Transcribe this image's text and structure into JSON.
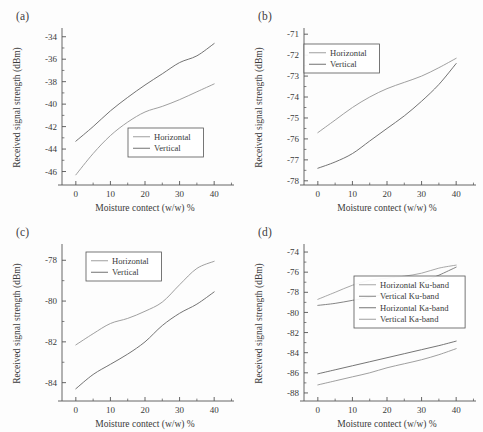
{
  "figure": {
    "background": "#fdfdfd",
    "axis_color": "#555555",
    "text_color": "#3a3a3a",
    "panel_count": 4
  },
  "common": {
    "xlabel": "Moisture contect (w/w) %",
    "ylabel": "Received signal strength (dBm)",
    "xticks": [
      0,
      10,
      20,
      30,
      40
    ],
    "xlim": [
      -4,
      44
    ]
  },
  "panels": [
    {
      "id": "a",
      "label": "(a)"
    },
    {
      "id": "b",
      "label": "(b)"
    },
    {
      "id": "c",
      "label": "(c)"
    },
    {
      "id": "d",
      "label": "(d)"
    }
  ],
  "chart_data": [
    {
      "panel": "a",
      "type": "line",
      "title": "(a)",
      "xlabel": "Moisture contect (w/w) %",
      "ylabel": "Received signal strength (dBm)",
      "xlim": [
        -4,
        44
      ],
      "ylim": [
        -47.2,
        -33.4
      ],
      "xticks": [
        0,
        10,
        20,
        30,
        40
      ],
      "yticks": [
        -34,
        -36,
        -38,
        -40,
        -42,
        -44,
        -46
      ],
      "grid": false,
      "legend_position": "lower-right",
      "x": [
        0,
        5,
        10,
        15,
        20,
        25,
        30,
        35,
        40
      ],
      "series": [
        {
          "name": "Horizontal",
          "color": "#9a9a9a",
          "values": [
            -46.3,
            -44.4,
            -42.8,
            -41.6,
            -40.7,
            -40.2,
            -39.6,
            -38.9,
            -38.2
          ]
        },
        {
          "name": "Vertical",
          "color": "#6b6b6b",
          "values": [
            -43.3,
            -42.0,
            -40.6,
            -39.4,
            -38.3,
            -37.3,
            -36.3,
            -35.7,
            -34.6
          ]
        }
      ]
    },
    {
      "panel": "b",
      "type": "line",
      "title": "(b)",
      "xlabel": "Moisture contect (w/w) %",
      "ylabel": "Received signal strength (dBm)",
      "xlim": [
        -4,
        44
      ],
      "ylim": [
        -78.2,
        -70.8
      ],
      "xticks": [
        0,
        10,
        20,
        30,
        40
      ],
      "yticks": [
        -71,
        -72,
        -73,
        -74,
        -75,
        -76,
        -77,
        -78
      ],
      "grid": false,
      "legend_position": "upper-left",
      "x": [
        0,
        5,
        10,
        15,
        20,
        25,
        30,
        35,
        40
      ],
      "series": [
        {
          "name": "Horizontal",
          "color": "#9a9a9a",
          "values": [
            -75.7,
            -75.1,
            -74.5,
            -74.0,
            -73.6,
            -73.3,
            -73.0,
            -72.6,
            -72.15
          ]
        },
        {
          "name": "Vertical",
          "color": "#6b6b6b",
          "values": [
            -77.4,
            -77.1,
            -76.7,
            -76.1,
            -75.5,
            -74.9,
            -74.2,
            -73.4,
            -72.4
          ]
        }
      ]
    },
    {
      "panel": "c",
      "type": "line",
      "title": "(c)",
      "xlabel": "Moisture contect (w/w) %",
      "ylabel": "Received signal strength (dBm)",
      "xlim": [
        -4,
        44
      ],
      "ylim": [
        -84.9,
        -77.3
      ],
      "xticks": [
        0,
        10,
        20,
        30,
        40
      ],
      "yticks": [
        -78,
        -80,
        -82,
        -84
      ],
      "grid": false,
      "legend_position": "upper-center",
      "x": [
        0,
        5,
        10,
        15,
        20,
        25,
        30,
        35,
        40
      ],
      "series": [
        {
          "name": "Horizontal",
          "color": "#9a9a9a",
          "values": [
            -82.15,
            -81.6,
            -81.1,
            -80.85,
            -80.5,
            -80.05,
            -79.2,
            -78.4,
            -78.05
          ]
        },
        {
          "name": "Vertical",
          "color": "#6b6b6b",
          "values": [
            -84.3,
            -83.6,
            -83.1,
            -82.6,
            -82.0,
            -81.2,
            -80.6,
            -80.15,
            -79.55
          ]
        }
      ]
    },
    {
      "panel": "d",
      "type": "line",
      "title": "(d)",
      "xlabel": "Moisture contect (w/w) %",
      "ylabel": "Received signal strength (dBm)",
      "xlim": [
        -4,
        44
      ],
      "ylim": [
        -88.8,
        -73.4
      ],
      "xticks": [
        0,
        10,
        20,
        30,
        40
      ],
      "yticks": [
        -74,
        -76,
        -78,
        -80,
        -82,
        -84,
        -86,
        -88
      ],
      "grid": false,
      "legend_position": "center-right",
      "x": [
        0,
        5,
        10,
        15,
        20,
        25,
        30,
        35,
        40
      ],
      "series": [
        {
          "name": "Horizontal Ku-band",
          "color": "#a2a2a2",
          "values": [
            -78.7,
            -78.0,
            -77.3,
            -76.8,
            -76.6,
            -76.4,
            -76.1,
            -75.6,
            -75.3
          ]
        },
        {
          "name": "Vertical Ku-band",
          "color": "#7d7d7d",
          "values": [
            -79.3,
            -79.1,
            -78.8,
            -78.5,
            -78.1,
            -77.6,
            -77.0,
            -76.3,
            -75.5
          ]
        },
        {
          "name": "Horizontal Ka-band",
          "color": "#6e6e6e",
          "values": [
            -86.1,
            -85.7,
            -85.3,
            -84.9,
            -84.5,
            -84.1,
            -83.7,
            -83.3,
            -82.85
          ]
        },
        {
          "name": "Vertical Ka-band",
          "color": "#9a9a9a",
          "values": [
            -87.2,
            -86.8,
            -86.4,
            -86.0,
            -85.5,
            -85.1,
            -84.7,
            -84.2,
            -83.6
          ]
        }
      ]
    }
  ]
}
